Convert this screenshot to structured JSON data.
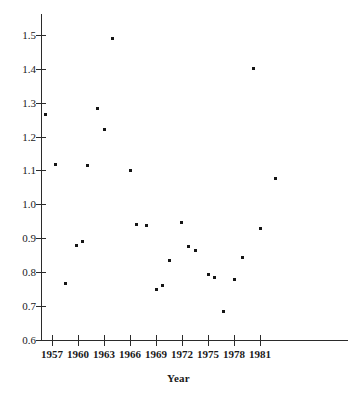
{
  "chart_data": {
    "type": "scatter",
    "title": "",
    "subtitle": "",
    "xlabel": "Year",
    "ylabel": "",
    "grid": false,
    "legend": null,
    "xlim": [
      1955.8,
      1987.4
    ],
    "ylim": [
      0.565,
      1.545
    ],
    "x_ticks": [
      1957,
      1960,
      1963,
      1966,
      1969,
      1972,
      1975,
      1978,
      1981
    ],
    "x_tick_labels": [
      "1957",
      "1960",
      "1963",
      "1966",
      "1969",
      "1972",
      "1975",
      "1978",
      "1981"
    ],
    "y_ticks": [
      0.6,
      0.7,
      0.8,
      0.9,
      1.0,
      1.1,
      1.2,
      1.3,
      1.4,
      1.5
    ],
    "y_tick_labels": [
      "0.6",
      "0.7",
      "0.8",
      "0.9",
      "1.0",
      "1.1",
      "1.2",
      "1.3",
      "1.4",
      "1.5"
    ],
    "x": [
      1956.2,
      1957.4,
      1958.6,
      1959.8,
      1960.5,
      1961.1,
      1962.3,
      1963.1,
      1964.0,
      1966.0,
      1966.8,
      1967.9,
      1969.0,
      1969.7,
      1970.5,
      1971.9,
      1972.7,
      1973.6,
      1975.0,
      1975.7,
      1976.8,
      1978.0,
      1979.0,
      1980.2,
      1981.1,
      1982.8
    ],
    "y": [
      1.267,
      1.117,
      0.767,
      0.878,
      0.891,
      1.113,
      1.285,
      1.221,
      1.489,
      1.099,
      0.941,
      0.938,
      0.748,
      0.76,
      0.835,
      0.946,
      0.875,
      0.863,
      0.792,
      0.785,
      0.684,
      0.779,
      0.843,
      1.402,
      0.927,
      1.074
    ],
    "points": [
      {
        "year": 1956.2,
        "value": 1.267
      },
      {
        "year": 1957.4,
        "value": 1.117
      },
      {
        "year": 1958.6,
        "value": 0.767
      },
      {
        "year": 1959.8,
        "value": 0.878
      },
      {
        "year": 1960.5,
        "value": 0.891
      },
      {
        "year": 1961.1,
        "value": 1.113
      },
      {
        "year": 1962.3,
        "value": 1.285
      },
      {
        "year": 1963.1,
        "value": 1.221
      },
      {
        "year": 1964.0,
        "value": 1.489
      },
      {
        "year": 1966.0,
        "value": 1.099
      },
      {
        "year": 1966.8,
        "value": 0.941
      },
      {
        "year": 1967.9,
        "value": 0.938
      },
      {
        "year": 1969.0,
        "value": 0.748
      },
      {
        "year": 1969.7,
        "value": 0.76
      },
      {
        "year": 1970.5,
        "value": 0.835
      },
      {
        "year": 1971.9,
        "value": 0.946
      },
      {
        "year": 1972.7,
        "value": 0.875
      },
      {
        "year": 1973.6,
        "value": 0.863
      },
      {
        "year": 1975.0,
        "value": 0.792
      },
      {
        "year": 1975.7,
        "value": 0.785
      },
      {
        "year": 1976.8,
        "value": 0.684
      },
      {
        "year": 1978.0,
        "value": 0.779
      },
      {
        "year": 1979.0,
        "value": 0.843
      },
      {
        "year": 1980.2,
        "value": 1.402
      },
      {
        "year": 1981.1,
        "value": 0.927
      },
      {
        "year": 1982.8,
        "value": 1.074
      }
    ],
    "marker": {
      "shape": "square",
      "size_px": 3,
      "color": "#151515"
    },
    "axis_color": "#2b2b2b",
    "background_color": "#ffffff"
  },
  "geometry": {
    "x_axis_px": {
      "left": 41,
      "right": 348,
      "y": 340
    },
    "y_axis_px": {
      "x": 41,
      "top": 14,
      "bottom": 341
    },
    "x_tick_px": [
      52,
      78,
      104,
      130,
      156,
      182,
      208,
      234,
      260
    ],
    "y_tick_px": [
      340,
      306,
      272,
      238,
      204,
      170,
      137,
      103,
      69,
      35
    ]
  }
}
